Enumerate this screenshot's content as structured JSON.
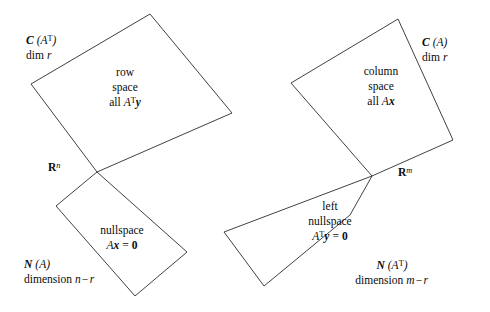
{
  "figure": {
    "background_color": "#ffffff",
    "stroke_color": "#2b2b2b"
  },
  "left_panel": {
    "domain_label": {
      "symbol": "R",
      "superscript": "n"
    },
    "top_shape": {
      "outer_label": {
        "line1_symbol": "C",
        "line1_arg": "(A",
        "line1_sup": "T",
        "line1_close": ")",
        "line2_word": "dim",
        "line2_var": "r"
      },
      "inner_label": {
        "line1": "row",
        "line2": "space",
        "line3_word": "all",
        "line3_matrix": "A",
        "line3_sup": "T",
        "line3_vector": "y"
      }
    },
    "bottom_shape": {
      "inner_label": {
        "line1": "nullspace",
        "line2_matrix": "A",
        "line2_vector": "x",
        "line2_eq": "=",
        "line2_zero": "0"
      },
      "outer_label": {
        "line1_symbol": "N",
        "line1_arg": "(A)",
        "line2_word": "dimension",
        "line2_expr": "n−r"
      }
    }
  },
  "right_panel": {
    "domain_label": {
      "symbol": "R",
      "superscript": "m"
    },
    "top_shape": {
      "outer_label": {
        "line1_symbol": "C",
        "line1_arg": "(A)",
        "line2_word": "dim",
        "line2_var": "r"
      },
      "inner_label": {
        "line1": "column",
        "line2": "space",
        "line3_word": "all",
        "line3_matrix": "A",
        "line3_vector": "x"
      }
    },
    "bottom_shape": {
      "inner_label": {
        "line1": "left",
        "line2": "nullspace",
        "line3_matrix": "A",
        "line3_sup": "T",
        "line3_vector": "y",
        "line3_eq": "=",
        "line3_zero": "0"
      },
      "outer_label": {
        "line1_symbol": "N",
        "line1_arg": "(A",
        "line1_sup": "T",
        "line1_close": ")",
        "line2_word": "dimension",
        "line2_expr": "m−r"
      }
    }
  },
  "geometry": {
    "left_top_points": "150,14 232,113 97,172 31,84",
    "left_bottom_points": "97,172 187,252 135,296 56,206",
    "right_top_points": "398,19 453,140 372,176 291,83",
    "right_bottom_points": "372,176 350,215 264,286 224,232"
  }
}
